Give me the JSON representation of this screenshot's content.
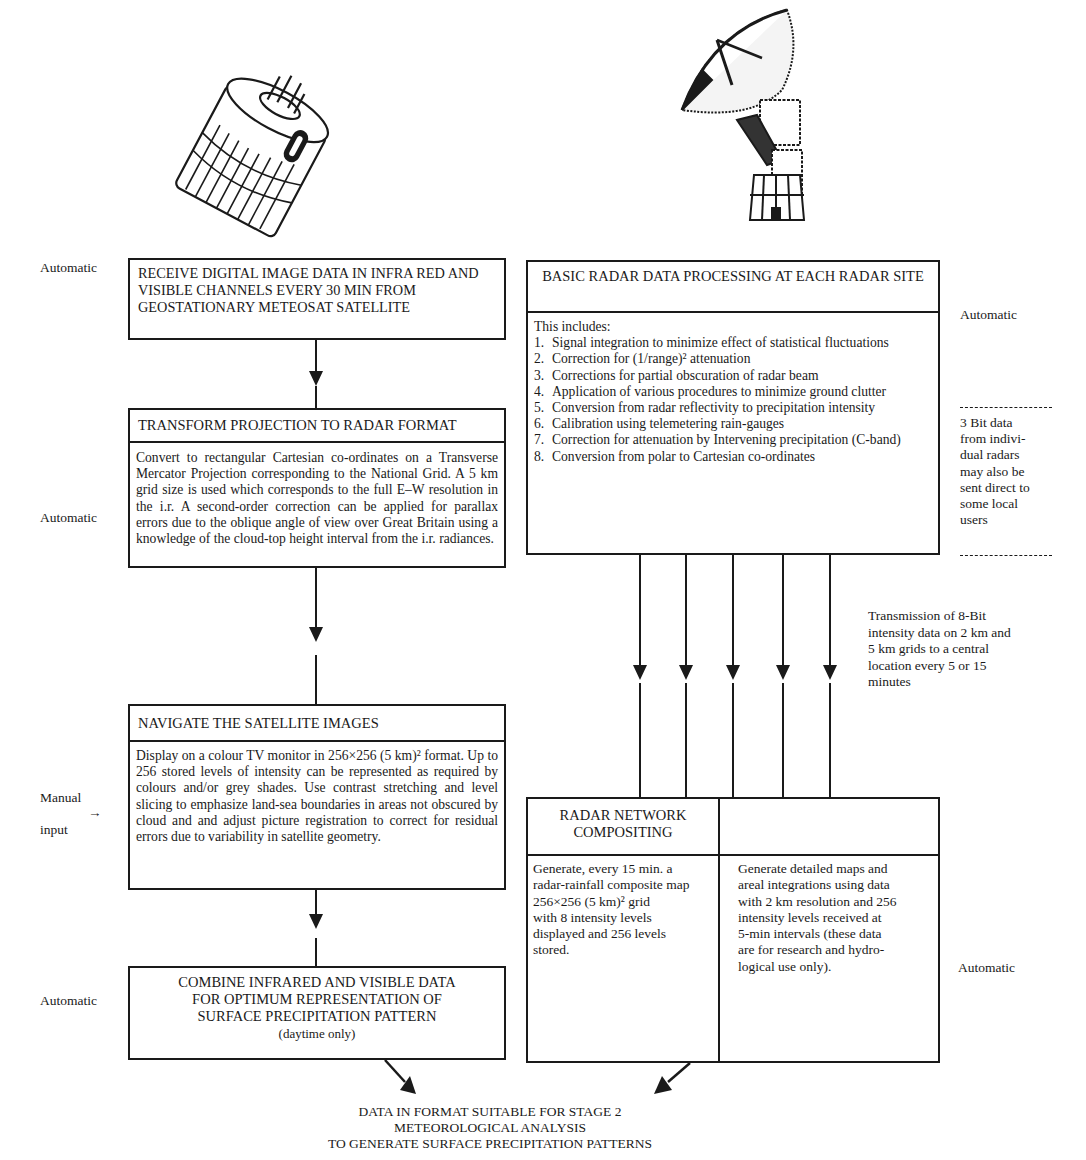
{
  "illustrations": {
    "satellite": "meteosat-satellite-illustration",
    "radar": "radar-dish-illustration"
  },
  "left_column": {
    "box1": {
      "title": "RECEIVE DIGITAL IMAGE DATA IN INFRA RED AND VISIBLE CHANNELS EVERY 30 MIN FROM GEOSTATIONARY METEOSAT SATELLITE",
      "side_label": "Automatic"
    },
    "box2": {
      "title": "TRANSFORM PROJECTION TO RADAR FORMAT",
      "body": "Convert to rectangular Cartesian co-ordinates on a Transverse Mercator Projection corresponding to the National Grid. A 5 km grid size is used which corresponds to the full E–W resolution in the i.r. A second-order correction can be applied for parallax errors due to the oblique angle of view over Great Britain using a knowledge of the cloud-top height interval from the i.r. radiances.",
      "side_label": "Automatic"
    },
    "box3": {
      "title": "NAVIGATE THE SATELLITE IMAGES",
      "body": "Display on a colour TV monitor in 256×256 (5 km)² format. Up to 256 stored levels of intensity can be represented as required by colours and/or grey shades. Use contrast stretching and level slicing to emphasize land-sea boundaries in areas not obscured by cloud and and adjust picture registration to correct for residual errors due to variability in satellite geometry.",
      "side_label_line1": "Manual",
      "side_arrow": "→",
      "side_label_line2": "input"
    },
    "box4": {
      "title_lines": [
        "COMBINE INFRARED AND VISIBLE DATA",
        "FOR OPTIMUM REPRESENTATION OF",
        "SURFACE PRECIPITATION PATTERN"
      ],
      "subtitle": "(daytime only)",
      "side_label": "Automatic"
    }
  },
  "right_column": {
    "radar_box": {
      "title": "BASIC RADAR DATA PROCESSING AT EACH RADAR SITE",
      "intro": "This includes:",
      "items": [
        {
          "n": "1.",
          "text": "Signal integration to minimize effect of statistical fluctuations"
        },
        {
          "n": "2.",
          "text": "Correction for (1/range)² attenuation"
        },
        {
          "n": "3.",
          "text": "Corrections for partial obscuration of radar beam"
        },
        {
          "n": "4.",
          "text": "Application of various procedures to minimize ground clutter"
        },
        {
          "n": "5.",
          "text": "Conversion from radar reflectivity to precipitation intensity"
        },
        {
          "n": "6.",
          "text": "Calibration using telemetering rain-gauges"
        },
        {
          "n": "7.",
          "text": "Correction for attenuation by Intervening precipitation (C-band)"
        },
        {
          "n": "8.",
          "text": "Conversion from polar to Cartesian co-ordinates"
        }
      ],
      "side_label": "Automatic"
    },
    "note_3bit": {
      "lines": [
        "3 Bit data",
        "from indivi-",
        "dual radars",
        "may also be",
        "sent direct to",
        "some local",
        "users"
      ]
    },
    "transmission_note": {
      "lines": [
        "Transmission of 8-Bit",
        "intensity data on 2 km and",
        "5 km grids to a central",
        "location every 5 or 15",
        "minutes"
      ]
    },
    "composite_box": {
      "left_title_lines": [
        "RADAR NETWORK",
        "COMPOSITING"
      ],
      "left_body_lines": [
        "Generate, every 15 min. a",
        "radar-rainfall composite map",
        "256×256 (5 km)² grid",
        "with 8 intensity levels",
        "displayed and 256 levels",
        "stored."
      ],
      "right_title": "",
      "right_body_lines": [
        "Generate detailed maps and",
        "areal integrations using data",
        "with 2 km resolution and 256",
        "intensity levels received at",
        "5-min intervals (these data",
        "are for research and hydro-",
        "logical use only)."
      ],
      "side_label": "Automatic"
    }
  },
  "output": {
    "lines": [
      "DATA IN FORMAT SUITABLE FOR STAGE 2",
      "METEOROLOGICAL ANALYSIS",
      "TO GENERATE SURFACE PRECIPITATION PATTERNS"
    ]
  }
}
